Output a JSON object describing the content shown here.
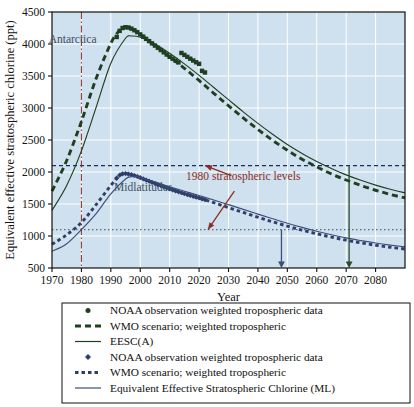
{
  "chart_data": {
    "type": "line",
    "title": "",
    "xlabel": "Year",
    "ylabel": "Equivalent effective stratospheric chlorine (ppt)",
    "xlim": [
      1970,
      2090
    ],
    "ylim": [
      500,
      4500
    ],
    "xticks": [
      1970,
      1980,
      1990,
      2000,
      2010,
      2020,
      2030,
      2040,
      2050,
      2060,
      2070,
      2080
    ],
    "yticks": [
      500,
      1000,
      1500,
      2000,
      2500,
      3000,
      3500,
      4000,
      4500
    ],
    "grid": true,
    "legend_position": "below-plot",
    "plot_background": "#cfe0ee",
    "gridline_color": "#ffffff",
    "annotations": [
      {
        "name": "antarctica-label",
        "text": "Antarctica",
        "x": 1977,
        "y": 4010
      },
      {
        "name": "midlatitudes-label",
        "text": "Midlatitudes",
        "x": 2001,
        "y": 1700
      },
      {
        "name": "1980-levels-label",
        "text": "1980 stratospheric levels",
        "x": 2035,
        "y": 1870
      }
    ],
    "reference_lines": [
      {
        "name": "antarctic-1980-level",
        "type": "horizontal",
        "value": 2100,
        "style": "dashed",
        "color": "#14325a"
      },
      {
        "name": "midlatitude-1980-level",
        "type": "horizontal",
        "value": 1100,
        "style": "dotted",
        "color": "#5a6a80"
      },
      {
        "name": "year-1980-marker",
        "type": "vertical",
        "value": 1980,
        "style": "dash-dot",
        "color": "#8a2f26"
      }
    ],
    "recovery_arrows": [
      {
        "name": "midlatitude-recovery-arrow",
        "year": 2048,
        "from": 1100,
        "to": 500,
        "color": "#3c4f78"
      },
      {
        "name": "antarctic-recovery-arrow",
        "year": 2071,
        "from": 2100,
        "to": 500,
        "color": "#2d4a2a"
      }
    ],
    "series": [
      {
        "name": "NOAA observation weighted tropospheric data",
        "region": "Antarctica",
        "style": "markers",
        "color": "#1f4020",
        "x": [
          1992,
          1993,
          1994,
          1995,
          1996,
          1997,
          1998,
          1999,
          2000,
          2001,
          2002,
          2003,
          2004,
          2005,
          2006,
          2007,
          2008,
          2009,
          2010,
          2011,
          2012,
          2013,
          2014,
          2015,
          2016,
          2017,
          2018,
          2019,
          2020,
          2021,
          2022
        ],
        "values": [
          4110,
          4205,
          4250,
          4262,
          4258,
          4240,
          4215,
          4185,
          4150,
          4115,
          4080,
          4045,
          4010,
          3975,
          3940,
          3905,
          3870,
          3835,
          3800,
          3770,
          3740,
          3712,
          3860,
          3830,
          3800,
          3770,
          3742,
          3715,
          3690,
          3580,
          3555
        ]
      },
      {
        "name": "WMO scenario; weighted tropospheric",
        "region": "Antarctica",
        "style": "dashed-thick",
        "color": "#1f4020",
        "x": [
          1970,
          1975,
          1980,
          1985,
          1990,
          1993,
          1995,
          1997,
          2000,
          2005,
          2010,
          2015,
          2020,
          2025,
          2030,
          2035,
          2040,
          2045,
          2050,
          2055,
          2060,
          2065,
          2070,
          2075,
          2080,
          2085,
          2090
        ],
        "values": [
          1700,
          2180,
          2790,
          3460,
          4010,
          4215,
          4258,
          4240,
          4150,
          3975,
          3800,
          3620,
          3430,
          3230,
          3035,
          2845,
          2665,
          2495,
          2340,
          2200,
          2080,
          1970,
          1875,
          1790,
          1715,
          1650,
          1595
        ]
      },
      {
        "name": "EESC(A)",
        "region": "Antarctica",
        "style": "solid-thin",
        "color": "#1f4020",
        "x": [
          1970,
          1975,
          1980,
          1985,
          1990,
          1995,
          1997,
          2000,
          2005,
          2010,
          2015,
          2020,
          2025,
          2030,
          2035,
          2040,
          2045,
          2050,
          2055,
          2060,
          2065,
          2070,
          2075,
          2080,
          2085,
          2090
        ],
        "values": [
          1400,
          1790,
          2330,
          3010,
          3700,
          4090,
          4125,
          4105,
          4000,
          3855,
          3690,
          3510,
          3320,
          3130,
          2940,
          2760,
          2590,
          2430,
          2290,
          2165,
          2055,
          1955,
          1870,
          1795,
          1730,
          1675
        ]
      },
      {
        "name": "NOAA observation weighted tropospheric data",
        "region": "Midlatitudes",
        "style": "markers",
        "color": "#2e3f6b",
        "x": [
          1992,
          1993,
          1994,
          1995,
          1996,
          1997,
          1998,
          1999,
          2000,
          2001,
          2002,
          2003,
          2004,
          2005,
          2006,
          2007,
          2008,
          2009,
          2010,
          2011,
          2012,
          2013,
          2014,
          2015,
          2016,
          2017,
          2018,
          2019,
          2020,
          2021,
          2022
        ],
        "values": [
          1905,
          1950,
          1972,
          1975,
          1968,
          1958,
          1945,
          1930,
          1912,
          1893,
          1874,
          1856,
          1838,
          1820,
          1802,
          1785,
          1768,
          1752,
          1736,
          1720,
          1705,
          1690,
          1676,
          1662,
          1648,
          1634,
          1620,
          1607,
          1594,
          1580,
          1568
        ]
      },
      {
        "name": "WMO scenario; weighted tropospheric",
        "region": "Midlatitudes",
        "style": "dotted-thick",
        "color": "#2e3f6b",
        "x": [
          1970,
          1975,
          1980,
          1985,
          1990,
          1993,
          1995,
          1997,
          2000,
          2005,
          2010,
          2015,
          2020,
          2025,
          2030,
          2035,
          2040,
          2045,
          2050,
          2055,
          2060,
          2065,
          2070,
          2075,
          2080,
          2085,
          2090
        ],
        "values": [
          870,
          1020,
          1210,
          1490,
          1790,
          1950,
          1975,
          1958,
          1912,
          1820,
          1736,
          1662,
          1594,
          1520,
          1444,
          1368,
          1294,
          1222,
          1155,
          1092,
          1035,
          982,
          935,
          893,
          856,
          824,
          797
        ]
      },
      {
        "name": "Equivalent Effective Stratospheric Chlorine (ML)",
        "region": "Midlatitudes",
        "style": "solid-thin",
        "color": "#3c4f78",
        "x": [
          1970,
          1975,
          1980,
          1985,
          1990,
          1995,
          1997,
          2000,
          2005,
          2010,
          2015,
          2020,
          2025,
          2030,
          2035,
          2040,
          2045,
          2050,
          2055,
          2060,
          2065,
          2070,
          2075,
          2080,
          2085,
          2090
        ],
        "values": [
          760,
          880,
          1100,
          1350,
          1660,
          1890,
          1925,
          1915,
          1845,
          1768,
          1700,
          1632,
          1562,
          1490,
          1416,
          1342,
          1270,
          1200,
          1135,
          1075,
          1020,
          970,
          928,
          890,
          858,
          830
        ]
      }
    ]
  },
  "legend": {
    "items": [
      {
        "label": "NOAA observation weighted tropospheric data",
        "marker": "dot",
        "color": "#1f4020"
      },
      {
        "label": "WMO scenario; weighted tropospheric",
        "marker": "dashed-thick",
        "color": "#1f4020"
      },
      {
        "label": "EESC(A)",
        "marker": "solid",
        "color": "#1f4020"
      },
      {
        "label": "NOAA observation weighted tropospheric data",
        "marker": "diamond",
        "color": "#2e3f6b"
      },
      {
        "label": "WMO scenario; weighted tropospheric",
        "marker": "dotted-thick",
        "color": "#2e3f6b"
      },
      {
        "label": "Equivalent Effective Stratospheric Chlorine (ML)",
        "marker": "solid",
        "color": "#3c4f78"
      }
    ]
  }
}
